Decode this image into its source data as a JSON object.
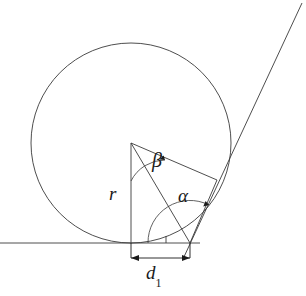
{
  "diagram": {
    "background_color": "#ffffff",
    "line_color": "#3a3a3a",
    "text_color": "#1a1a1a",
    "labels": {
      "radius": "r",
      "angle_alpha": "α",
      "angle_beta": "β",
      "distance_symbol": "d",
      "distance_subscript": "1"
    },
    "geometry": {
      "circle": {
        "cx": 131,
        "cy": 143,
        "r": 100
      },
      "ground_line": {
        "x1": 0,
        "y1": 243,
        "x2": 200,
        "y2": 243
      },
      "radius_vertical": {
        "x1": 131,
        "y1": 143,
        "x2": 131,
        "y2": 243
      },
      "center_to_apex": {
        "x1": 131,
        "y1": 143,
        "x2": 190,
        "y2": 243
      },
      "center_to_tangent": {
        "x1": 131,
        "y1": 143,
        "x2": 217,
        "y2": 180
      },
      "apex_to_tangent": {
        "x1": 190,
        "y1": 243,
        "x2": 217,
        "y2": 180
      },
      "tangent_line": {
        "x1": 183,
        "y1": 259,
        "x2": 302,
        "y2": 3
      },
      "apex_point": {
        "x": 190,
        "y": 243
      },
      "tangent_point": {
        "x": 217,
        "y": 180
      },
      "dimension_line": {
        "x1": 131,
        "y1": 258,
        "x2": 190,
        "y2": 258
      }
    }
  }
}
